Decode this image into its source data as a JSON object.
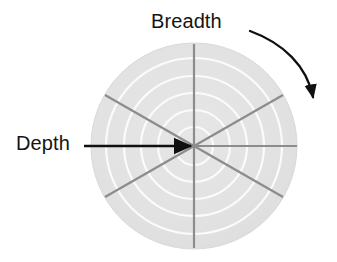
{
  "figure": {
    "width": 337,
    "height": 262,
    "background_color": "#ffffff"
  },
  "labels": {
    "breadth": "Breadth",
    "depth": "Depth"
  },
  "diagram": {
    "disc": {
      "center_x": 194,
      "center_y": 146,
      "radius": 103,
      "fill_color": "#e3e3e3",
      "edge_color": "#dcdcdc"
    },
    "rings": {
      "count": 5,
      "radii": [
        19,
        36,
        53,
        70,
        88
      ],
      "color": "#fbfbfb",
      "width": 2.2
    },
    "spokes": {
      "count": 3,
      "angles_deg": [
        90,
        30,
        150
      ],
      "color": "#8c8c8c",
      "width": 2.2
    },
    "radial_axis": {
      "angle_deg": 0,
      "color": "#8c8c8c",
      "width": 2.2
    },
    "depth_arrow": {
      "start_x": 84,
      "start_y": 146,
      "end_x": 193,
      "end_y": 146,
      "color": "#101010"
    },
    "breadth_arrow": {
      "type": "curved-clockwise",
      "start_x": 250,
      "start_y": 31,
      "end_x": 314,
      "end_y": 101,
      "color": "#101010"
    }
  }
}
